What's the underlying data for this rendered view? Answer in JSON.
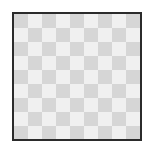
{
  "image": {
    "kind": "transparency-checkerboard",
    "cell_size_px": 14,
    "colors": {
      "light": "#f0f0f0",
      "dark": "#d6d6d6",
      "border": "#2b2b2b",
      "background": "#ffffff"
    }
  }
}
